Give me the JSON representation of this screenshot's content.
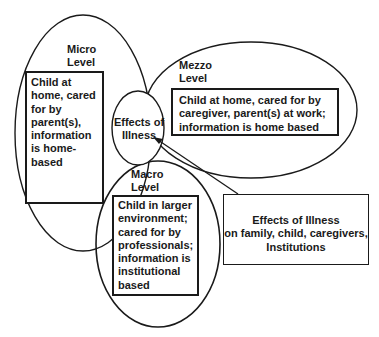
{
  "diagram": {
    "micro": {
      "title_line1": "Micro",
      "title_line2": "Level",
      "box_text": [
        "Child at",
        "home, cared",
        "for by",
        "parent(s),",
        "information",
        "is home-",
        "based"
      ]
    },
    "mezzo": {
      "title_line1": "Mezzo",
      "title_line2": "Level",
      "box_text": [
        "Child at home, cared for by",
        "caregiver, parent(s) at work;",
        "information is home based"
      ]
    },
    "macro": {
      "title_line1": "Macro",
      "title_line2": "Level",
      "box_text": [
        "Child in larger",
        "environment;",
        "cared for by",
        "professionals;",
        "information is",
        "institutional",
        "based"
      ]
    },
    "center": {
      "line1": "Effects of",
      "line2": "Illness"
    },
    "effects_box": {
      "text": [
        "Effects of Illness",
        "on family, child, caregivers,",
        "Institutions"
      ]
    },
    "colors": {
      "stroke": "#1a1a1a",
      "background": "#ffffff"
    }
  }
}
